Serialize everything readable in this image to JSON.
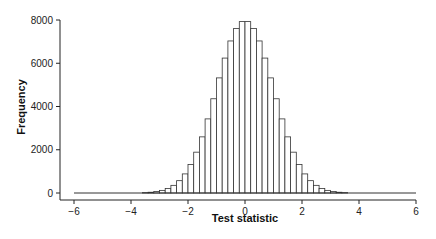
{
  "chart_data": {
    "type": "bar",
    "title": "",
    "xlabel": "Test statistic",
    "ylabel": "Frequency",
    "xlim": [
      -6,
      6
    ],
    "ylim": [
      0,
      8000
    ],
    "x_ticks": [
      -6,
      -4,
      -2,
      0,
      2,
      4,
      6
    ],
    "x_tick_labels": [
      "−6",
      "−4",
      "−2",
      "0",
      "2",
      "4",
      "6"
    ],
    "y_ticks": [
      0,
      2000,
      4000,
      6000,
      8000
    ],
    "y_tick_labels": [
      "0",
      "2000",
      "4000",
      "6000",
      "8000"
    ],
    "grid": false,
    "legend": null,
    "bin_width": 0.2,
    "bin_edges_start": -6.0,
    "bins": [
      {
        "x0": -3.6,
        "x1": -3.4,
        "count": 18
      },
      {
        "x0": -3.4,
        "x1": -3.2,
        "count": 35
      },
      {
        "x0": -3.2,
        "x1": -3.0,
        "count": 66
      },
      {
        "x0": -3.0,
        "x1": -2.8,
        "count": 121
      },
      {
        "x0": -2.8,
        "x1": -2.6,
        "count": 211
      },
      {
        "x0": -2.6,
        "x1": -2.4,
        "count": 354
      },
      {
        "x0": -2.4,
        "x1": -2.2,
        "count": 570
      },
      {
        "x0": -2.2,
        "x1": -2.0,
        "count": 883
      },
      {
        "x0": -2.0,
        "x1": -1.8,
        "count": 1316
      },
      {
        "x0": -1.8,
        "x1": -1.6,
        "count": 1888
      },
      {
        "x0": -1.6,
        "x1": -1.4,
        "count": 2596
      },
      {
        "x0": -1.4,
        "x1": -1.2,
        "count": 3427
      },
      {
        "x0": -1.2,
        "x1": -1.0,
        "count": 4358
      },
      {
        "x0": -1.0,
        "x1": -0.8,
        "count": 5323
      },
      {
        "x0": -0.8,
        "x1": -0.6,
        "count": 6239
      },
      {
        "x0": -0.6,
        "x1": -0.4,
        "count": 7031
      },
      {
        "x0": -0.4,
        "x1": -0.2,
        "count": 7611
      },
      {
        "x0": -0.2,
        "x1": 0.0,
        "count": 7926
      },
      {
        "x0": 0.0,
        "x1": 0.2,
        "count": 7926
      },
      {
        "x0": 0.2,
        "x1": 0.4,
        "count": 7611
      },
      {
        "x0": 0.4,
        "x1": 0.6,
        "count": 7031
      },
      {
        "x0": 0.6,
        "x1": 0.8,
        "count": 6239
      },
      {
        "x0": 0.8,
        "x1": 1.0,
        "count": 5323
      },
      {
        "x0": 1.0,
        "x1": 1.2,
        "count": 4358
      },
      {
        "x0": 1.2,
        "x1": 1.4,
        "count": 3427
      },
      {
        "x0": 1.4,
        "x1": 1.6,
        "count": 2596
      },
      {
        "x0": 1.6,
        "x1": 1.8,
        "count": 1888
      },
      {
        "x0": 1.8,
        "x1": 2.0,
        "count": 1316
      },
      {
        "x0": 2.0,
        "x1": 2.2,
        "count": 883
      },
      {
        "x0": 2.2,
        "x1": 2.4,
        "count": 570
      },
      {
        "x0": 2.4,
        "x1": 2.6,
        "count": 354
      },
      {
        "x0": 2.6,
        "x1": 2.8,
        "count": 211
      },
      {
        "x0": 2.8,
        "x1": 3.0,
        "count": 121
      },
      {
        "x0": 3.0,
        "x1": 3.2,
        "count": 66
      },
      {
        "x0": 3.2,
        "x1": 3.4,
        "count": 35
      },
      {
        "x0": 3.4,
        "x1": 3.6,
        "count": 18
      }
    ],
    "style": {
      "bar_fill": "#ffffff",
      "bar_stroke": "#333333",
      "axis_color": "#222222"
    }
  }
}
